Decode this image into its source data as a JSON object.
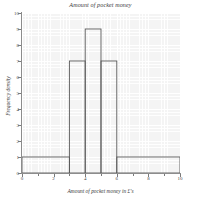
{
  "chart_data": {
    "type": "bar",
    "title": "Amount of pocket money",
    "xlabel": "Amount of pocket money in £'s",
    "ylabel": "Frequency density",
    "xlim": [
      0,
      10
    ],
    "ylim": [
      0,
      10
    ],
    "grid": true,
    "legend": null,
    "bar_style": {
      "fill": "none",
      "edge_color": "#595959",
      "edge_width": 0.9
    },
    "bins": [
      {
        "start": 0,
        "end": 3,
        "height": 1
      },
      {
        "start": 3,
        "end": 4,
        "height": 7
      },
      {
        "start": 4,
        "end": 5,
        "height": 9
      },
      {
        "start": 5,
        "end": 6,
        "height": 7
      },
      {
        "start": 6,
        "end": 10,
        "height": 1
      }
    ],
    "categories": [
      "0-3",
      "3-4",
      "4-5",
      "5-6",
      "6-10"
    ],
    "values": [
      1,
      7,
      9,
      7,
      1
    ],
    "x_ticks": [
      {
        "value": 0,
        "label": "0"
      },
      {
        "value": 2,
        "label": "2"
      },
      {
        "value": 4,
        "label": "4"
      },
      {
        "value": 6,
        "label": "6"
      },
      {
        "value": 8,
        "label": "8"
      },
      {
        "value": 10,
        "label": "10"
      }
    ],
    "x_minor_ticks": [
      1,
      3,
      5,
      7,
      9
    ],
    "y_ticks": [
      {
        "value": 0,
        "label": "0"
      },
      {
        "value": 1,
        "label": "1"
      },
      {
        "value": 2,
        "label": "2"
      },
      {
        "value": 3,
        "label": "3"
      },
      {
        "value": 4,
        "label": "4"
      },
      {
        "value": 5,
        "label": "5"
      },
      {
        "value": 6,
        "label": "6"
      },
      {
        "value": 7,
        "label": "7"
      },
      {
        "value": 8,
        "label": "8"
      },
      {
        "value": 9,
        "label": "9"
      },
      {
        "value": 10,
        "label": "10"
      }
    ],
    "colors": {
      "plot_background": "#f4f4f4",
      "grid_line": "#ffffff",
      "axis_line": "#8c8c8c",
      "bar_outline": "#595959",
      "text": "#3a3a3a",
      "page_background": "#ffffff"
    }
  }
}
